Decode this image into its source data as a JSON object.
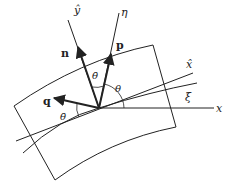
{
  "diagram": {
    "axes": {
      "x": "x",
      "y_hat": "ŷ",
      "x_hat": "x̂",
      "eta": "η",
      "xi": "ξ"
    },
    "vectors": {
      "n": "n",
      "p": "p",
      "q": "q"
    },
    "angles": {
      "theta": "θ",
      "theta_bar_top": "θ̄",
      "theta_bar_left": "θ̄"
    },
    "colors": {
      "stroke": "#222222",
      "background": "#ffffff"
    }
  }
}
